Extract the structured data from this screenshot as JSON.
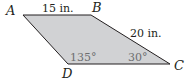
{
  "figure": {
    "type": "parallelogram",
    "fill_color": "#d1d2d4",
    "stroke_color": "#231f20",
    "vertices": {
      "A": {
        "label": "A"
      },
      "B": {
        "label": "B"
      },
      "C": {
        "label": "C"
      },
      "D": {
        "label": "D"
      }
    },
    "measures": {
      "AB": "15 in.",
      "BC": "20 in."
    },
    "angles": {
      "D": "135°",
      "C": "30°"
    }
  }
}
